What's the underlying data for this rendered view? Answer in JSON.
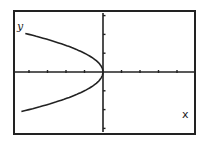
{
  "chart_data": {
    "type": "line",
    "title": "",
    "xlabel": "x",
    "ylabel": "y",
    "equation": "x = -y^2",
    "xlim": [
      -5,
      5
    ],
    "ylim": [
      -3.3,
      3.3
    ],
    "x_ticks": [
      -4,
      -3,
      -2,
      -1,
      1,
      2,
      3,
      4
    ],
    "y_ticks": [
      -3,
      -2,
      -1,
      1,
      2,
      3
    ],
    "grid": false,
    "series": [
      {
        "name": "upper branch",
        "points": [
          [
            -4.1,
            2.05
          ],
          [
            -3,
            1.73
          ],
          [
            -2,
            1.41
          ],
          [
            -1,
            1
          ],
          [
            -0.25,
            0.5
          ],
          [
            0,
            0
          ]
        ]
      },
      {
        "name": "lower branch",
        "points": [
          [
            0,
            0
          ],
          [
            -0.25,
            -0.5
          ],
          [
            -1,
            -1
          ],
          [
            -2,
            -1.41
          ],
          [
            -3,
            -1.73
          ],
          [
            -4.6,
            -2.14
          ]
        ]
      }
    ]
  },
  "labels": {
    "x_axis": "x",
    "y_axis": "y"
  }
}
